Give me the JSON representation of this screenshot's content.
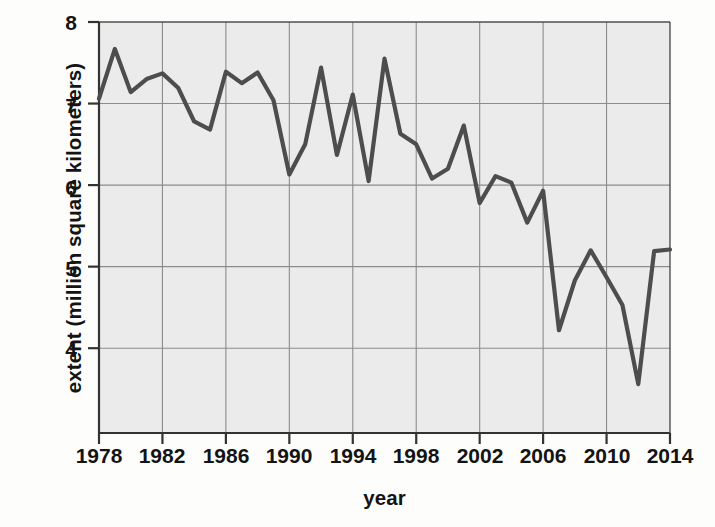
{
  "chart_data": {
    "type": "line",
    "title": "",
    "xlabel": "year",
    "ylabel": "extent (million square kilometers)",
    "xlim": [
      1978,
      2014
    ],
    "ylim": [
      2.96,
      8
    ],
    "xticks": [
      1978,
      1982,
      1986,
      1990,
      1994,
      1998,
      2002,
      2006,
      2010,
      2014
    ],
    "yticks": [
      4,
      5,
      6,
      7,
      8
    ],
    "grid": true,
    "legend": null,
    "line_color": "#4d4d4d",
    "plot_background": "#ebebeb",
    "grid_color": "#8c8c8c",
    "x": [
      1978,
      1979,
      1980,
      1981,
      1982,
      1983,
      1984,
      1985,
      1986,
      1987,
      1988,
      1989,
      1990,
      1991,
      1992,
      1993,
      1994,
      1995,
      1996,
      1997,
      1998,
      1999,
      2000,
      2001,
      2002,
      2003,
      2004,
      2005,
      2006,
      2007,
      2008,
      2009,
      2010,
      2011,
      2012,
      2013,
      2014
    ],
    "values": [
      7.06,
      7.67,
      7.14,
      7.3,
      7.37,
      7.19,
      6.78,
      6.68,
      7.39,
      7.25,
      7.38,
      7.04,
      6.13,
      6.5,
      7.44,
      6.37,
      7.11,
      6.05,
      7.55,
      6.63,
      6.5,
      6.08,
      6.2,
      6.73,
      5.78,
      6.11,
      6.03,
      5.54,
      5.93,
      4.22,
      4.83,
      5.2,
      4.87,
      4.53,
      3.56,
      5.19,
      5.21
    ]
  },
  "ticks": {
    "y": [
      "8",
      "7",
      "6",
      "5",
      "4"
    ],
    "x": [
      "1978",
      "1982",
      "1986",
      "1990",
      "1994",
      "1998",
      "2002",
      "2006",
      "2010",
      "2014"
    ]
  },
  "labels": {
    "y_title": "extent (million square kilometers)",
    "x_title": "year"
  }
}
